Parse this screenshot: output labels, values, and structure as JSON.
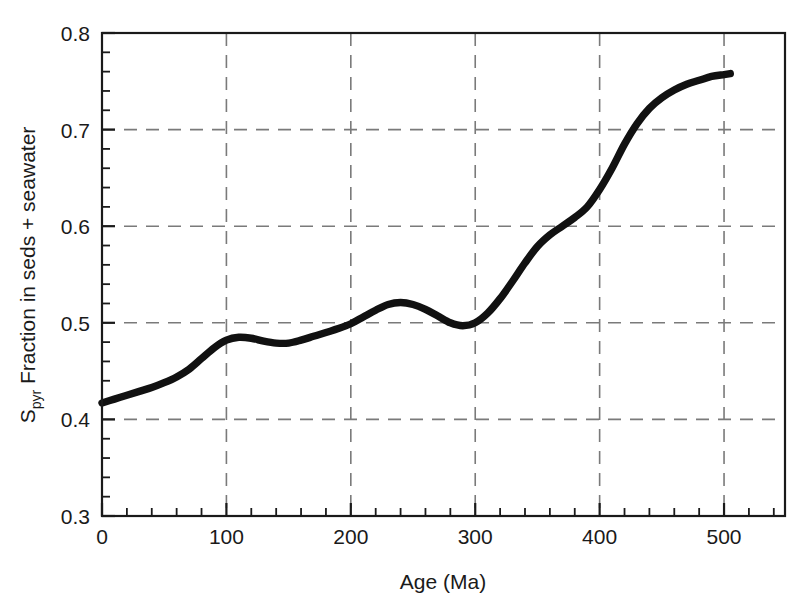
{
  "chart_data": {
    "type": "line",
    "title": "",
    "xlabel": "Age (Ma)",
    "ylabel": "S_pyr Fraction in seds + seawater",
    "ylabel_parts": {
      "main_prefix": "S",
      "subscript": "pyr",
      "main_suffix": " Fraction in seds + seawater"
    },
    "xlim": [
      0,
      549
    ],
    "ylim": [
      0.3,
      0.8
    ],
    "x_major_ticks": [
      0,
      100,
      200,
      300,
      400,
      500
    ],
    "x_tick_labels": [
      "0",
      "100",
      "200",
      "300",
      "400",
      "500"
    ],
    "x_minor_interval": 20,
    "y_major_ticks": [
      0.3,
      0.4,
      0.5,
      0.6,
      0.7,
      0.8
    ],
    "y_tick_labels": [
      "0.3",
      "0.4",
      "0.5",
      "0.6",
      "0.7",
      "0.8"
    ],
    "y_minor_interval": 0.02,
    "grid": true,
    "grid_style": "dashed",
    "grid_color": "#7a7a7a",
    "legend": "none",
    "series": [
      {
        "name": "Spyr fraction",
        "color": "#111111",
        "line_width": 7.4,
        "x": [
          0,
          10,
          20,
          30,
          40,
          50,
          60,
          70,
          80,
          90,
          100,
          110,
          120,
          130,
          140,
          150,
          160,
          170,
          180,
          190,
          200,
          210,
          220,
          230,
          240,
          250,
          260,
          270,
          280,
          290,
          300,
          310,
          320,
          330,
          340,
          350,
          360,
          370,
          380,
          390,
          400,
          410,
          420,
          430,
          440,
          450,
          460,
          470,
          480,
          490,
          500,
          505
        ],
        "y": [
          0.417,
          0.421,
          0.425,
          0.429,
          0.433,
          0.438,
          0.444,
          0.452,
          0.463,
          0.474,
          0.482,
          0.485,
          0.484,
          0.481,
          0.479,
          0.479,
          0.482,
          0.486,
          0.49,
          0.494,
          0.499,
          0.506,
          0.513,
          0.519,
          0.521,
          0.519,
          0.514,
          0.507,
          0.5,
          0.497,
          0.5,
          0.51,
          0.525,
          0.543,
          0.562,
          0.579,
          0.591,
          0.6,
          0.609,
          0.62,
          0.638,
          0.66,
          0.685,
          0.706,
          0.722,
          0.733,
          0.741,
          0.747,
          0.751,
          0.755,
          0.757,
          0.758
        ]
      }
    ],
    "annotations": [
      {
        "label": "local maximum",
        "x": 100,
        "y": 0.485
      },
      {
        "label": "local minimum",
        "x": 143,
        "y": 0.479
      },
      {
        "label": "local maximum",
        "x": 240,
        "y": 0.521
      },
      {
        "label": "local minimum",
        "x": 288,
        "y": 0.497
      },
      {
        "label": "curve endpoint",
        "x": 505,
        "y": 0.758
      }
    ]
  },
  "axes": {
    "x_title": "Age (Ma)",
    "y_title_prefix": "S",
    "y_title_subscript": "pyr",
    "y_title_suffix": " Fraction in seds + seawater"
  }
}
